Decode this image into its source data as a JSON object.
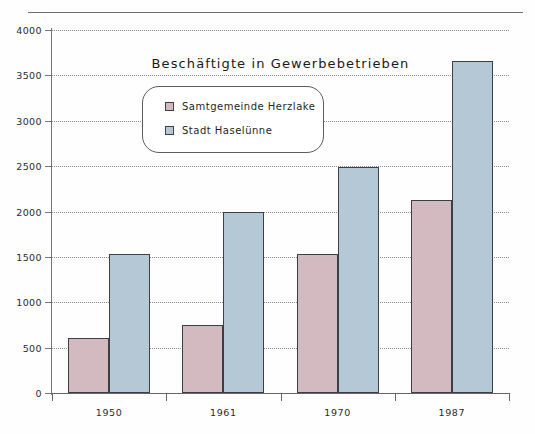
{
  "chart_data": {
    "type": "bar",
    "title": "Beschäftigte in Gewerbebetrieben",
    "xlabel": "",
    "ylabel": "",
    "categories": [
      "1950",
      "1961",
      "1970",
      "1987"
    ],
    "series": [
      {
        "name": "Samtgemeinde Herzlake",
        "color": "#d2bac0",
        "values": [
          610,
          750,
          1530,
          2130
        ]
      },
      {
        "name": "Stadt Haselünne",
        "color": "#b5c8d5",
        "values": [
          1530,
          2000,
          2490,
          3660
        ]
      }
    ],
    "ylim": [
      0,
      4000
    ],
    "yticks": [
      0,
      500,
      1000,
      1500,
      2000,
      2500,
      3000,
      3500,
      4000
    ],
    "ytick_labels": [
      "0",
      "500",
      "1000",
      "1500",
      "2000",
      "2500",
      "3000",
      "3500",
      "4000"
    ],
    "grid": true,
    "grid_style": "dotted-horizontal",
    "legend_position": "upper-center-inset",
    "bar_style": "grouped-adjacent"
  }
}
